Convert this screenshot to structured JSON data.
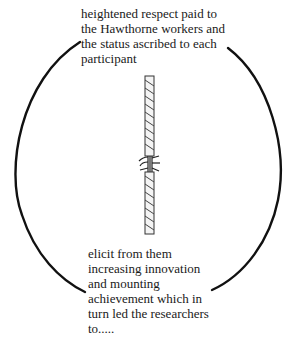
{
  "diagram": {
    "top_text": {
      "lines": [
        "heightened respect paid to",
        "the Hawthorne workers and",
        "the status ascribed to each",
        "participant"
      ]
    },
    "bottom_text": {
      "lines": [
        "elicit from them",
        "increasing innovation",
        "and mounting",
        "achievement which in",
        "turn led the researchers",
        "to....."
      ]
    },
    "center_image": "frayed-rope-icon",
    "cycle_shape": "circular-arc-arrows",
    "colors": {
      "line": "#111111",
      "text": "#1a1a1a",
      "background": "#ffffff"
    }
  }
}
